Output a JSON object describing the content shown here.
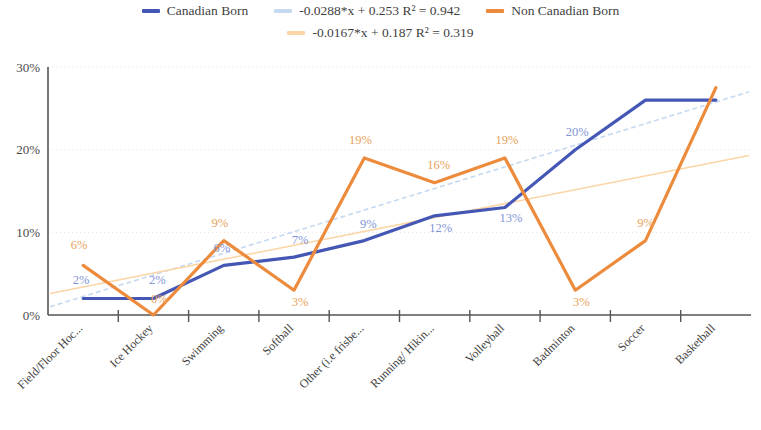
{
  "legend": {
    "items": [
      {
        "label": "Canadian Born",
        "color": "#4457b5",
        "type": "series"
      },
      {
        "label": "-0.0288*x + 0.253 R² = 0.942",
        "color": "#c5d9f1",
        "type": "trendline"
      },
      {
        "label": "Non Canadian Born",
        "color": "#ed8b3c",
        "type": "series"
      },
      {
        "label": "-0.0167*x + 0.187 R² = 0.319",
        "color": "#fbd5a5",
        "type": "trendline"
      }
    ]
  },
  "axes": {
    "y_ticks": [
      "0%",
      "10%",
      "20%",
      "30%"
    ],
    "y_min": 0,
    "y_max": 30
  },
  "chart_data": {
    "type": "line",
    "title": "",
    "xlabel": "",
    "ylabel": "",
    "ylim": [
      0,
      30
    ],
    "y_tick_labels": [
      "0%",
      "10%",
      "20%",
      "30%"
    ],
    "grid": true,
    "legend_position": "top",
    "categories": [
      "Field/Floor Hoc...",
      "Ice Hockey",
      "Swimming",
      "Softball",
      "Other (i.e frisbe...",
      "Running/ Hikin...",
      "Volleyball",
      "Badminton",
      "Soccer",
      "Basketball"
    ],
    "series": [
      {
        "name": "Canadian Born",
        "color": "#4457b5",
        "values": [
          2,
          2,
          6,
          7,
          9,
          12,
          13,
          20,
          26,
          26
        ],
        "labels": [
          "2%",
          "2%",
          "6%",
          "7%",
          "9%",
          "12%",
          "13%",
          "20%",
          "",
          ""
        ],
        "label_color": "#7f94d6"
      },
      {
        "name": "Non Canadian Born",
        "color": "#ed8b3c",
        "values": [
          6,
          0,
          9,
          3,
          19,
          16,
          19,
          3,
          9,
          27.5
        ],
        "labels": [
          "6%",
          "0%",
          "9%",
          "3%",
          "19%",
          "16%",
          "19%",
          "3%",
          "9%",
          ""
        ],
        "label_color": "#e8a25a"
      }
    ],
    "trendlines": [
      {
        "name": "-0.0288*x + 0.253 R² = 0.942",
        "equation": "-0.0288*x + 0.253 R² = 0.942",
        "slope": 0.0288,
        "intercept": 0.253,
        "r2": 0.942,
        "color": "#c5d9f1",
        "for_series": "Canadian Born",
        "y_start": 1.0,
        "y_end": 27.0,
        "dashed": true
      },
      {
        "name": "-0.0167*x + 0.187 R² = 0.319",
        "equation": "-0.0167*x + 0.187 R² = 0.319",
        "slope": 0.0167,
        "intercept": 0.187,
        "r2": 0.319,
        "color": "#fbd5a5",
        "for_series": "Non Canadian Born",
        "y_start": 2.6,
        "y_end": 19.3,
        "dashed": false
      }
    ]
  }
}
